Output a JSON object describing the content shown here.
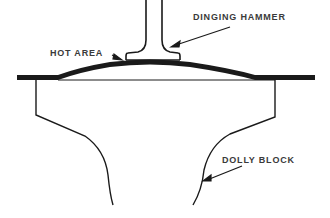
{
  "diagram": {
    "labels": {
      "hammer": "DINGING HAMMER",
      "hot_area": "HOT AREA",
      "dolly": "DOLLY BLOCK"
    },
    "colors": {
      "ink": "#1a1a1a",
      "text": "#3a3a3a",
      "background": "#ffffff"
    }
  }
}
